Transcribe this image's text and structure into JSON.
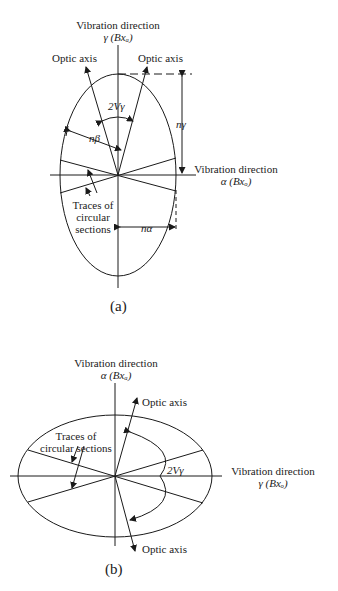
{
  "diagram_a": {
    "top_label_line1": "Vibration direction",
    "top_label_line2": "γ (Bxₐ)",
    "optic_axis_left": "Optic axis",
    "optic_axis_right": "Optic axis",
    "angle_label": "2Vγ",
    "n_beta": "nβ",
    "n_gamma": "nγ",
    "n_alpha": "nα",
    "right_label_line1": "Vibration direction",
    "right_label_line2": "α (Bxₒ)",
    "traces_line1": "Traces of",
    "traces_line2": "circular",
    "traces_line3": "sections",
    "caption": "(a)"
  },
  "diagram_b": {
    "top_label_line1": "Vibration direction",
    "top_label_line2": "α (Bxₐ)",
    "optic_axis_top": "Optic axis",
    "optic_axis_bottom": "Optic axis",
    "angle_label": "2Vγ",
    "right_label_line1": "Vibration direction",
    "right_label_line2": "γ (Bxₒ)",
    "traces_line1": "Traces of",
    "traces_line2": "circular sections",
    "caption": "(b)"
  },
  "colors": {
    "ink": "#1a1a1a",
    "background": "#ffffff"
  }
}
